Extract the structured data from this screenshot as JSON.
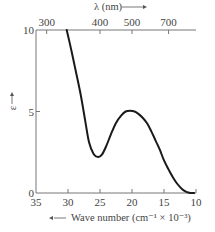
{
  "chart_data": {
    "type": "line",
    "title": "",
    "xlabel": "Wave number (cm⁻¹ × 10⁻³)",
    "xlabel_arrow": "←",
    "x2label": "λ (nm)",
    "x2label_arrow": "→",
    "ylabel": "ε",
    "ylabel_arrow": "↑",
    "xlim": [
      35,
      10
    ],
    "ylim": [
      0,
      10
    ],
    "x_ticks": [
      35,
      30,
      25,
      20,
      15,
      10
    ],
    "x_tick_labels": [
      "35",
      "30",
      "25",
      "20",
      "15",
      "10"
    ],
    "y_ticks": [
      0,
      5,
      10
    ],
    "y_tick_labels": [
      "0",
      "5",
      "10"
    ],
    "x2_ticks_nm": [
      300,
      400,
      500,
      700
    ],
    "x2_tick_labels": [
      "300",
      "400",
      "500",
      "700"
    ],
    "grid": false,
    "legend": null,
    "series": [
      {
        "name": "absorption spectrum",
        "x": [
          30.2,
          29.5,
          28.8,
          28.0,
          27.3,
          26.7,
          26.0,
          25.3,
          24.7,
          24.0,
          23.3,
          22.5,
          21.7,
          21.0,
          20.3,
          19.6,
          19.0,
          18.3,
          17.6,
          17.0,
          16.3,
          15.6,
          15.0,
          14.3,
          13.6,
          12.9,
          12.2,
          11.5,
          10.9,
          10.3
        ],
        "y": [
          10.0,
          8.8,
          7.5,
          6.0,
          4.4,
          3.1,
          2.4,
          2.2,
          2.35,
          2.9,
          3.6,
          4.3,
          4.75,
          5.0,
          5.05,
          5.0,
          4.85,
          4.6,
          4.25,
          3.8,
          3.2,
          2.6,
          2.0,
          1.45,
          0.95,
          0.55,
          0.25,
          0.07,
          0.0,
          0.0
        ]
      }
    ],
    "annotations": {
      "minimum": {
        "x": 25.3,
        "y": 2.2
      },
      "maximum": {
        "x": 20.0,
        "y": 5.05
      }
    }
  }
}
